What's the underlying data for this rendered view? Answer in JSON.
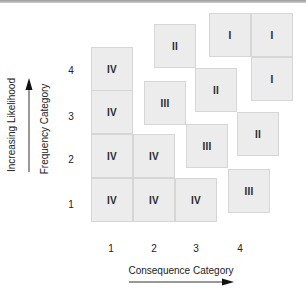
{
  "diagram": {
    "type": "risk-matrix",
    "y_axis": {
      "outer_label": "Increasing Likelihood",
      "inner_label": "Frequency Category",
      "ticks": [
        "4",
        "3",
        "2",
        "1"
      ]
    },
    "x_axis": {
      "label": "Consequence Category",
      "ticks": [
        "1",
        "2",
        "3",
        "4"
      ]
    },
    "cells": [
      {
        "label": "IV",
        "x": 91,
        "y": 47
      },
      {
        "label": "IV",
        "x": 91,
        "y": 90
      },
      {
        "label": "IV",
        "x": 91,
        "y": 134
      },
      {
        "label": "IV",
        "x": 91,
        "y": 178
      },
      {
        "label": "IV",
        "x": 133,
        "y": 134
      },
      {
        "label": "IV",
        "x": 133,
        "y": 178
      },
      {
        "label": "IV",
        "x": 175,
        "y": 178
      },
      {
        "label": "III",
        "x": 144,
        "y": 81
      },
      {
        "label": "III",
        "x": 186,
        "y": 124
      },
      {
        "label": "III",
        "x": 228,
        "y": 169
      },
      {
        "label": "II",
        "x": 154,
        "y": 24
      },
      {
        "label": "II",
        "x": 195,
        "y": 68
      },
      {
        "label": "II",
        "x": 237,
        "y": 112
      },
      {
        "label": "I",
        "x": 209,
        "y": 13
      },
      {
        "label": "I",
        "x": 251,
        "y": 13
      },
      {
        "label": "I",
        "x": 251,
        "y": 57
      }
    ]
  }
}
